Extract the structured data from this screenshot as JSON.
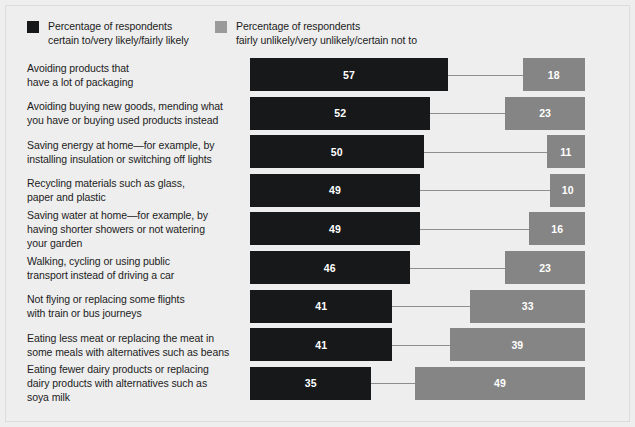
{
  "legend": {
    "positive": {
      "swatch_color": "#16181a",
      "line1": "Percentage of respondents",
      "line2": "certain to/very likely/fairly likely"
    },
    "negative": {
      "swatch_color": "#9a9a9a",
      "line1": "Percentage of respondents",
      "line2": "fairly unlikely/very unlikely/certain not to"
    }
  },
  "chart_data": {
    "type": "bar",
    "title": "",
    "subtitle": "",
    "xlabel": "",
    "ylabel": "",
    "orientation": "horizontal",
    "layout": "paired-diverging",
    "grid": false,
    "legend_position": "top-left",
    "xlim": [
      0,
      60
    ],
    "categories": [
      "Avoiding products that have a lot of packaging",
      "Avoiding buying new goods, mending what you have or buying used products instead",
      "Saving energy at home—for example, by installing insulation or switching off lights",
      "Recycling materials such as glass, paper and plastic",
      "Saving water at home—for example, by having shorter showers or not watering your garden",
      "Walking, cycling or using public transport instead of driving a car",
      "Not flying or replacing some flights with train or bus journeys",
      "Eating less meat or replacing the meat in some meals with alternatives such as beans",
      "Eating fewer dairy products or replacing dairy products with alternatives such as soya milk"
    ],
    "category_lines": [
      [
        "Avoiding products that",
        "have a lot of packaging"
      ],
      [
        "Avoiding buying new goods, mending what",
        "you have or buying used products instead"
      ],
      [
        "Saving energy at home—for example, by",
        "installing insulation or switching off lights"
      ],
      [
        "Recycling materials such as glass,",
        "paper and plastic"
      ],
      [
        "Saving water at home—for example, by",
        "having shorter showers or not watering",
        "your garden"
      ],
      [
        "Walking, cycling or using public",
        "transport instead of driving a car"
      ],
      [
        "Not flying or replacing some flights",
        "with train or bus journeys"
      ],
      [
        "Eating less meat or replacing the meat in",
        "some meals with alternatives such as beans"
      ],
      [
        "Eating fewer dairy products or replacing",
        "dairy products with alternatives such as",
        "soya milk"
      ]
    ],
    "series": [
      {
        "name": "Percentage of respondents certain to/very likely/fairly likely",
        "color": "#16181a",
        "values": [
          57,
          52,
          50,
          49,
          49,
          46,
          41,
          41,
          35
        ]
      },
      {
        "name": "Percentage of respondents fairly unlikely/very unlikely/certain not to",
        "color": "#858585",
        "values": [
          18,
          23,
          11,
          10,
          16,
          23,
          33,
          39,
          49
        ]
      }
    ]
  }
}
